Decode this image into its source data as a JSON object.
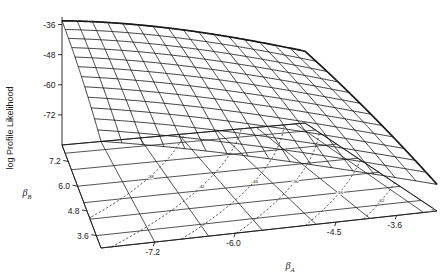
{
  "figure": {
    "type": "3d-surface-wireframe-with-contours",
    "background": "#ffffff",
    "line_color": "#1a1a1a"
  },
  "axes": {
    "z": {
      "label": "log Profile Likelihood",
      "ticks": [
        "-36",
        "-48",
        "-60",
        "-72"
      ],
      "values": [
        -36,
        -48,
        -60,
        -72
      ],
      "range": [
        -84,
        -33
      ]
    },
    "x": {
      "label": "β",
      "label_sub": "A",
      "ticks": [
        "-7.2",
        "-6.0",
        "-4.5",
        "-3.6"
      ],
      "values": [
        -7.2,
        -6.0,
        -4.5,
        -3.6
      ],
      "range": [
        -8.0,
        -3.0
      ]
    },
    "y": {
      "label": "β",
      "label_sub": "B",
      "ticks": [
        "7.2",
        "6.0",
        "4.8",
        "3.6"
      ],
      "values": [
        7.2,
        6.0,
        4.8,
        3.6
      ],
      "range": [
        3.0,
        8.0
      ]
    }
  },
  "chart_data": {
    "type": "surface",
    "title": "",
    "xlabel": "β_A",
    "ylabel": "β_B",
    "zlabel": "log Profile Likelihood",
    "xlim": [
      -8.0,
      -3.0
    ],
    "ylim": [
      3.0,
      8.0
    ],
    "zlim": [
      -84,
      -33
    ],
    "grid": true,
    "legend": "none",
    "xticks": [
      -7.2,
      -6.0,
      -4.5,
      -3.6
    ],
    "yticks": [
      7.2,
      6.0,
      4.8,
      3.6
    ],
    "zticks": [
      -36,
      -48,
      -60,
      -72
    ],
    "surface_model": {
      "description": "Quadratic log profile likelihood ridge, maximum near upper-left (small beta_A, large beta_B), falling steeply toward large beta_A and small beta_B.",
      "peak_xy": [
        -8.0,
        8.0
      ],
      "peak_z": -34.5,
      "coef_x2": -0.55,
      "coef_y2": -0.28,
      "coef_xy": 0.62,
      "nx": 17,
      "ny": 13
    },
    "contours": {
      "style": "dashed",
      "projected_on": "floor",
      "levels": [
        -38,
        -42,
        -46,
        -50,
        -56,
        -62,
        -70,
        -78
      ],
      "labels": [
        "-38",
        "-42",
        "-46",
        "-50",
        "-56",
        "-62",
        "-70",
        "-78"
      ]
    },
    "floor_grid": {
      "x_lines": [
        -8.0,
        -7.2,
        -6.4,
        -5.6,
        -4.8,
        -4.0,
        -3.2,
        -3.0
      ],
      "y_lines": [
        3.0,
        3.6,
        4.4,
        5.2,
        6.0,
        6.8,
        7.6,
        8.0
      ]
    }
  }
}
